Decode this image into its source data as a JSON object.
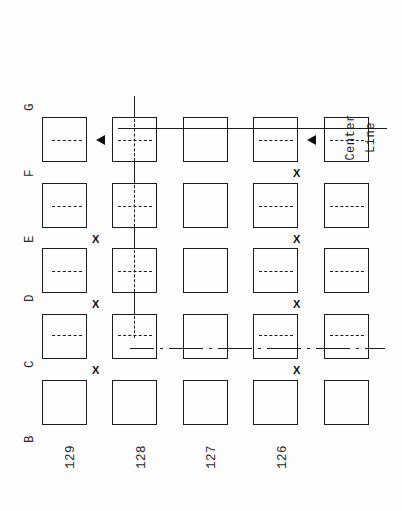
{
  "diagram": {
    "orientation": "rotated-90",
    "row_labels": [
      "G",
      "F",
      "E",
      "D",
      "C",
      "B"
    ],
    "column_labels": [
      "129",
      "128",
      "127",
      "126"
    ],
    "annotation": {
      "center_line_line1": "Center",
      "center_line_line2": "Line"
    },
    "x_marks_label": "X",
    "colors": {
      "ink": "#1c1c1c",
      "background": "#fdfdfd"
    },
    "grid": {
      "rows": 5,
      "columns": 5,
      "cell_states": [
        [
          "dashed",
          "dashed-cross",
          "empty",
          "dashed",
          "dashed"
        ],
        [
          "dashed",
          "dashed-cross",
          "empty",
          "dashed",
          "dashed"
        ],
        [
          "dashed",
          "dashed-cross",
          "empty",
          "dashed",
          "dashed"
        ],
        [
          "dashed",
          "dashed-cross",
          "empty",
          "dashed",
          "dashed"
        ],
        [
          "empty",
          "empty",
          "empty",
          "empty",
          "empty"
        ]
      ]
    },
    "markers": {
      "arrowheads": 2,
      "x_mark_count": 6
    }
  }
}
